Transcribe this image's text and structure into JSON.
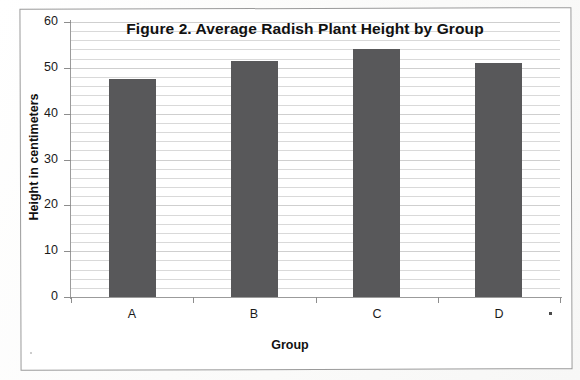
{
  "chart_data": {
    "type": "bar",
    "title": "Figure 2. Average Radish Plant Height by Group",
    "xlabel": "Group",
    "ylabel": "Height in centimeters",
    "categories": [
      "A",
      "B",
      "C",
      "D"
    ],
    "values": [
      47.5,
      51.5,
      54.0,
      51.0
    ],
    "series": [
      {
        "name": "Average height",
        "values": [
          47.5,
          51.5,
          54.0,
          51.0
        ]
      }
    ],
    "ylim": [
      0,
      60
    ],
    "ytick_labels": [
      "0",
      "10",
      "20",
      "30",
      "40",
      "50",
      "60"
    ],
    "ytick_values": [
      0,
      10,
      20,
      30,
      40,
      50,
      60
    ],
    "minor_tick_step": 2,
    "grid": "horizontal",
    "legend": "none",
    "bar_color": "#58585a",
    "gridline_color": "#d9d9d9",
    "axis_color": "#9b9b9b",
    "background": "#ffffff"
  },
  "page": {
    "frame_border_color": "#9a9a9a",
    "paper_color": "#fcfcfb"
  }
}
